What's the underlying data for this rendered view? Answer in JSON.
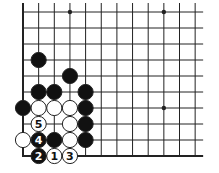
{
  "diagram": {
    "type": "go-board-diagram",
    "grid": {
      "columns": 12,
      "rows": 10,
      "origin_x": 23,
      "origin_y": 12,
      "spacing_x": 15.65,
      "spacing_y": 16.0,
      "left_edge": true,
      "bottom_edge": true,
      "top_open": true,
      "right_open": true,
      "line_color": "#222222"
    },
    "star_points": [
      {
        "col": 3,
        "row": 0
      },
      {
        "col": 9,
        "row": 0
      },
      {
        "col": 9,
        "row": 6
      }
    ],
    "stones": [
      {
        "col": 1,
        "row": 3,
        "color": "black",
        "label": ""
      },
      {
        "col": 3,
        "row": 4,
        "color": "black",
        "label": ""
      },
      {
        "col": 1,
        "row": 5,
        "color": "black",
        "label": ""
      },
      {
        "col": 2,
        "row": 5,
        "color": "black",
        "label": ""
      },
      {
        "col": 4,
        "row": 5,
        "color": "black",
        "label": ""
      },
      {
        "col": 0,
        "row": 6,
        "color": "black",
        "label": ""
      },
      {
        "col": 1,
        "row": 6,
        "color": "white",
        "label": ""
      },
      {
        "col": 2,
        "row": 6,
        "color": "white",
        "label": ""
      },
      {
        "col": 3,
        "row": 6,
        "color": "white",
        "label": ""
      },
      {
        "col": 4,
        "row": 6,
        "color": "black",
        "label": ""
      },
      {
        "col": 1,
        "row": 7,
        "color": "white",
        "label": "5"
      },
      {
        "col": 3,
        "row": 7,
        "color": "white",
        "label": ""
      },
      {
        "col": 4,
        "row": 7,
        "color": "black",
        "label": ""
      },
      {
        "col": 0,
        "row": 8,
        "color": "white",
        "label": ""
      },
      {
        "col": 1,
        "row": 8,
        "color": "black",
        "label": "4"
      },
      {
        "col": 2,
        "row": 8,
        "color": "black",
        "label": ""
      },
      {
        "col": 3,
        "row": 8,
        "color": "white",
        "label": ""
      },
      {
        "col": 4,
        "row": 8,
        "color": "black",
        "label": ""
      },
      {
        "col": 1,
        "row": 9,
        "color": "black",
        "label": "2"
      },
      {
        "col": 2,
        "row": 9,
        "color": "white",
        "label": "1"
      },
      {
        "col": 3,
        "row": 9,
        "color": "white",
        "label": "3"
      }
    ],
    "colors": {
      "black_stone": "#111111",
      "white_stone": "#ffffff",
      "stone_outline": "#222222",
      "background": "#ffffff"
    }
  }
}
